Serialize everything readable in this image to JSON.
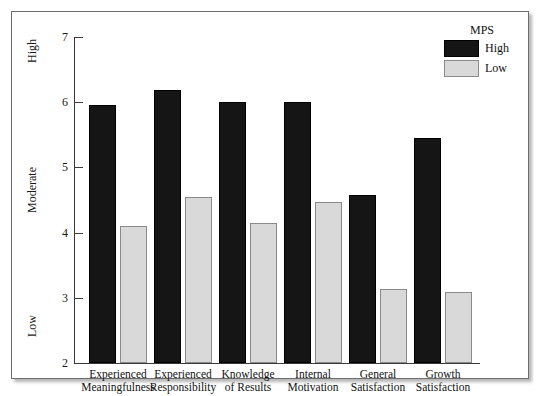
{
  "chart_data": {
    "type": "bar",
    "title": "",
    "subtitle": "",
    "xlabel": "",
    "ylabel": "",
    "categories": [
      "Experienced Meaningfulness",
      "Experienced Responsibility",
      "Knowledge of Results",
      "Internal Motivation",
      "General Satisfaction",
      "Growth Satisfaction"
    ],
    "category_lines": [
      [
        "Experienced",
        "Meaningfulness"
      ],
      [
        "Experienced",
        "Responsibility"
      ],
      [
        "Knowledge",
        "of Results"
      ],
      [
        "Internal",
        "Motivation"
      ],
      [
        "General",
        "Satisfaction"
      ],
      [
        "Growth",
        "Satisfaction"
      ]
    ],
    "series": [
      {
        "name": "High",
        "color": "#151515",
        "values": [
          5.95,
          6.18,
          6.0,
          6.0,
          4.58,
          5.45
        ]
      },
      {
        "name": "Low",
        "color": "#d9d9d9",
        "values": [
          4.1,
          4.55,
          4.15,
          4.47,
          3.14,
          3.09
        ]
      }
    ],
    "ylim": [
      2,
      7
    ],
    "yticks": [
      2,
      3,
      4,
      5,
      6,
      7
    ],
    "ytick_labels": [
      "2",
      "3",
      "4",
      "5",
      "6",
      "7"
    ],
    "y_qualitative_labels": [
      {
        "text": "High",
        "value": 6.6
      },
      {
        "text": "Moderate",
        "value": 4.3
      },
      {
        "text": "Low",
        "value": 2.4
      }
    ],
    "grid": false,
    "legend_position": "top-right"
  },
  "legend": {
    "title": "MPS",
    "entries": [
      {
        "label": "High",
        "color": "#151515"
      },
      {
        "label": "Low",
        "color": "#d9d9d9"
      }
    ]
  }
}
